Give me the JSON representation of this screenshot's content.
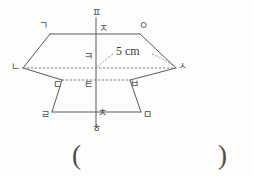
{
  "figure": {
    "dimension": {
      "value": "5",
      "unit": "cm",
      "text": "5 cm"
    },
    "vertices": [
      {
        "id": "g",
        "label": "ㄱ",
        "x": 43,
        "y": 28,
        "role": "top-face-front-left"
      },
      {
        "id": "o",
        "label": "ㅇ",
        "x": 143,
        "y": 28,
        "role": "top-face-front-right"
      },
      {
        "id": "n",
        "label": "ㄴ",
        "x": 17,
        "y": 64,
        "role": "top-face-left"
      },
      {
        "id": "s",
        "label": "ㅅ",
        "x": 178,
        "y": 63,
        "role": "top-face-right"
      },
      {
        "id": "d",
        "label": "ㄷ",
        "x": 57,
        "y": 84,
        "role": "bottom-face-back-left"
      },
      {
        "id": "b",
        "label": "ㅂ",
        "x": 134,
        "y": 83,
        "role": "bottom-face-back-right"
      },
      {
        "id": "r",
        "label": "ㄹ",
        "x": 45,
        "y": 115,
        "role": "bottom-face-front-left"
      },
      {
        "id": "m",
        "label": "ㅁ",
        "x": 145,
        "y": 115,
        "role": "bottom-face-front-right"
      },
      {
        "id": "p",
        "label": "ㅍ",
        "x": 95,
        "y": 12,
        "role": "axis-top"
      },
      {
        "id": "j",
        "label": "ㅈ",
        "x": 100,
        "y": 30,
        "role": "axis-upper"
      },
      {
        "id": "k",
        "label": "ㅋ",
        "x": 89,
        "y": 57,
        "role": "center"
      },
      {
        "id": "t",
        "label": "ㅌ",
        "x": 89,
        "y": 85,
        "role": "axis-lower-mid"
      },
      {
        "id": "ch",
        "label": "ㅊ",
        "x": 99,
        "y": 114,
        "role": "axis-lower"
      },
      {
        "id": "h",
        "label": "ㅎ",
        "x": 95,
        "y": 130,
        "role": "axis-bottom"
      }
    ],
    "edges": {
      "solid": [
        {
          "name": "edge-g-o",
          "x1": 50,
          "y1": 34,
          "x2": 140,
          "y2": 34
        },
        {
          "name": "edge-g-n",
          "x1": 50,
          "y1": 34,
          "x2": 23,
          "y2": 68
        },
        {
          "name": "edge-o-s",
          "x1": 140,
          "y1": 34,
          "x2": 176,
          "y2": 68
        },
        {
          "name": "edge-n-d",
          "x1": 23,
          "y1": 68,
          "x2": 62,
          "y2": 80
        },
        {
          "name": "edge-s-b",
          "x1": 176,
          "y1": 68,
          "x2": 130,
          "y2": 80
        },
        {
          "name": "edge-d-r",
          "x1": 62,
          "y1": 80,
          "x2": 52,
          "y2": 112
        },
        {
          "name": "edge-b-m",
          "x1": 130,
          "y1": 80,
          "x2": 141,
          "y2": 112
        },
        {
          "name": "edge-r-m",
          "x1": 52,
          "y1": 112,
          "x2": 141,
          "y2": 112
        },
        {
          "name": "axis-vertical",
          "x1": 96,
          "y1": 18,
          "x2": 96,
          "y2": 126
        }
      ],
      "dashed": [
        {
          "name": "edge-n-s-diagonal",
          "x1": 23,
          "y1": 68,
          "x2": 176,
          "y2": 68
        },
        {
          "name": "edge-d-b-hidden",
          "x1": 62,
          "y1": 80,
          "x2": 130,
          "y2": 80
        },
        {
          "name": "radius-leader",
          "x1": 96,
          "y1": 68,
          "x2": 176,
          "y2": 68
        }
      ]
    }
  },
  "answer": {
    "open_paren": "(",
    "close_paren": ")"
  }
}
